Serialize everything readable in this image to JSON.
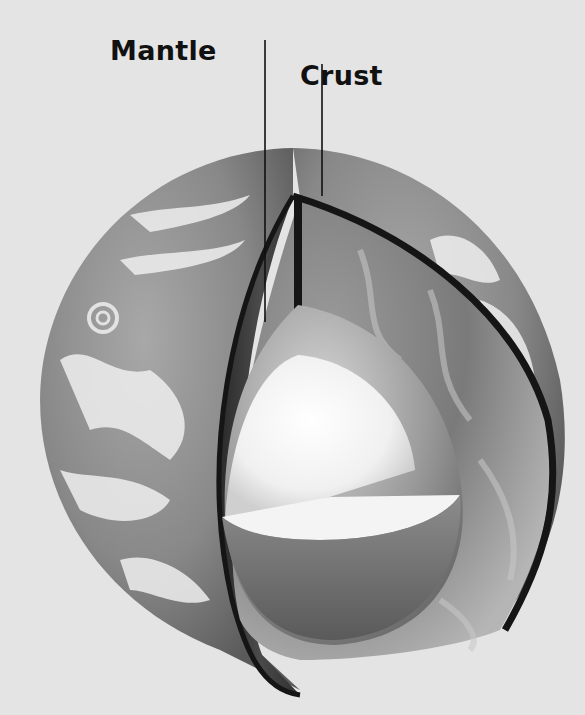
{
  "diagram": {
    "labels": [
      {
        "id": "mantle",
        "text": "Mantle"
      },
      {
        "id": "crust",
        "text": "Crust"
      }
    ],
    "layers_depicted": [
      "crust",
      "mantle",
      "outer core",
      "inner core"
    ],
    "colors": {
      "background": "#e4e4e4",
      "label_text": "#111111",
      "leader_line": "#111111",
      "crust_rim": "#151515",
      "ocean": "#8a8a8a",
      "clouds": "#f0f0f0",
      "mantle": "#7e7e7e",
      "outer_core": "#a8a8a8",
      "inner_core": "#f5f5f5"
    }
  }
}
